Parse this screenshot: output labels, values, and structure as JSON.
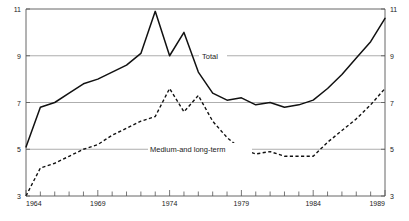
{
  "chart_data": {
    "type": "line",
    "title": "",
    "subtitle": "",
    "xlabel": "",
    "ylabel": "",
    "xlim": [
      1964,
      1989
    ],
    "ylim": [
      3,
      11
    ],
    "grid": true,
    "grid_axis": "y",
    "legend_position": "inline-annotations",
    "y_ticks": [
      3,
      5,
      7,
      9,
      11
    ],
    "y_tick_labels": [
      "3",
      "5",
      "7",
      "9",
      "11"
    ],
    "y_axis_both_sides": true,
    "x_ticks": [
      1964,
      1965,
      1966,
      1967,
      1968,
      1969,
      1970,
      1971,
      1972,
      1973,
      1974,
      1975,
      1976,
      1977,
      1978,
      1979,
      1980,
      1981,
      1982,
      1983,
      1984,
      1985,
      1986,
      1987,
      1988,
      1989
    ],
    "x_tick_labels_shown": [
      "1964",
      "1969",
      "1974",
      "1979",
      "1984",
      "1989"
    ],
    "x_labeled_years": [
      1964,
      1969,
      1974,
      1979,
      1984,
      1989
    ],
    "x": [
      1964,
      1965,
      1966,
      1967,
      1968,
      1969,
      1970,
      1971,
      1972,
      1973,
      1974,
      1975,
      1976,
      1977,
      1978,
      1979,
      1980,
      1981,
      1982,
      1983,
      1984,
      1985,
      1986,
      1987,
      1988,
      1989
    ],
    "series": [
      {
        "name": "Total",
        "style": "solid",
        "color": "#111111",
        "values": [
          5.1,
          6.8,
          7.0,
          7.4,
          7.8,
          8.0,
          8.3,
          8.6,
          9.1,
          10.9,
          9.0,
          10.0,
          8.3,
          7.4,
          7.1,
          7.2,
          6.9,
          7.0,
          6.8,
          6.9,
          7.1,
          7.6,
          8.2,
          8.9,
          9.6,
          10.6
        ]
      },
      {
        "name": "Medium-and long-term",
        "style": "dashed",
        "color": "#111111",
        "values": [
          3.0,
          4.2,
          4.4,
          4.7,
          5.0,
          5.2,
          5.6,
          5.9,
          6.2,
          6.4,
          7.6,
          6.6,
          7.3,
          6.2,
          5.5,
          5.0,
          4.8,
          4.9,
          4.7,
          4.7,
          4.7,
          5.3,
          5.8,
          6.3,
          6.9,
          7.6
        ]
      }
    ],
    "annotations": [
      {
        "name": "total-label",
        "text": "Total",
        "x": 1978.2,
        "y": 9.0
      },
      {
        "name": "medium-long-term-label",
        "text": "Medium-and long-term",
        "x": 1975.3,
        "y": 5.0
      }
    ]
  },
  "axis": {
    "y_left": [
      "11",
      "9",
      "7",
      "5",
      "3"
    ],
    "y_right": [
      "11",
      "9",
      "7",
      "5",
      "3"
    ],
    "x_labels": [
      "1964",
      "1969",
      "1974",
      "1979",
      "1984",
      "1989"
    ]
  },
  "labels": {
    "total": "Total",
    "medium_long_term": "Medium-and long-term"
  }
}
